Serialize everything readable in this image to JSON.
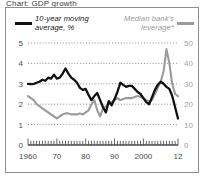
{
  "title_partial": "Chart: GDP growth",
  "legend": {
    "left": {
      "label": "10-year moving average, %",
      "color": "#111111",
      "swatch": "line-swatch-black"
    },
    "right": {
      "label": "Median bank's leverage*",
      "color": "#9b9b9b",
      "swatch": "line-swatch-grey"
    }
  },
  "chart_data": {
    "type": "line",
    "title": "Chart: GDP growth",
    "xlabel": "",
    "ylabel": "10-year moving average, %",
    "y2label": "Median bank's leverage*",
    "grid": true,
    "legend_position": "top",
    "xlim": [
      1960,
      2012
    ],
    "ylim": [
      0,
      5
    ],
    "y2lim": [
      0,
      50
    ],
    "yticks": [
      0,
      1,
      2,
      3,
      4,
      5
    ],
    "y2ticks": [
      0,
      10,
      20,
      30,
      40,
      50
    ],
    "xticks": [
      1960,
      1970,
      1980,
      1990,
      2000,
      2012
    ],
    "xticklabels": [
      "1960",
      "70",
      "80",
      "90",
      "2000",
      "12"
    ],
    "series": [
      {
        "name": "10-year moving average, %",
        "axis": "left",
        "color": "#111111",
        "x": [
          1960,
          1961,
          1962,
          1963,
          1964,
          1965,
          1966,
          1967,
          1968,
          1969,
          1970,
          1971,
          1972,
          1973,
          1974,
          1975,
          1976,
          1977,
          1978,
          1979,
          1980,
          1981,
          1982,
          1983,
          1984,
          1985,
          1986,
          1987,
          1988,
          1989,
          1990,
          1991,
          1992,
          1993,
          1994,
          1995,
          1996,
          1997,
          1998,
          1999,
          2000,
          2001,
          2002,
          2003,
          2004,
          2005,
          2006,
          2007,
          2008,
          2009,
          2010,
          2011,
          2012
        ],
        "values": [
          3.0,
          2.98,
          3.0,
          3.05,
          3.1,
          3.2,
          3.15,
          3.3,
          3.25,
          3.45,
          3.25,
          3.3,
          3.5,
          3.75,
          3.5,
          3.3,
          3.2,
          3.05,
          2.8,
          2.7,
          2.75,
          2.45,
          2.2,
          2.4,
          2.55,
          2.2,
          1.85,
          1.6,
          2.15,
          1.95,
          2.25,
          2.6,
          3.05,
          2.95,
          2.85,
          2.9,
          2.9,
          2.75,
          2.6,
          2.5,
          2.3,
          2.1,
          2.0,
          2.35,
          2.7,
          2.95,
          3.1,
          3.0,
          2.85,
          2.75,
          2.4,
          1.85,
          1.3
        ],
        "annotations": [
          {
            "x": 1973,
            "y": 3.75,
            "note": "peak"
          },
          {
            "x": 2012,
            "y": 1.3,
            "note": "final value"
          }
        ]
      },
      {
        "name": "Median bank's leverage*",
        "axis": "right",
        "color": "#9b9b9b",
        "x": [
          1960,
          1961,
          1962,
          1963,
          1964,
          1965,
          1966,
          1967,
          1968,
          1969,
          1970,
          1971,
          1972,
          1973,
          1974,
          1975,
          1976,
          1977,
          1978,
          1979,
          1980,
          1981,
          1982,
          1983,
          1984,
          1985,
          1986,
          1987,
          1988,
          1989,
          1990,
          1991,
          1992,
          1993,
          1994,
          1995,
          1996,
          1997,
          1998,
          1999,
          2000,
          2001,
          2002,
          2003,
          2004,
          2005,
          2006,
          2007,
          2008,
          2009,
          2010,
          2011,
          2012
        ],
        "values": [
          24,
          23,
          22,
          20,
          19,
          18,
          17,
          16,
          15,
          14,
          13,
          14,
          15,
          15.5,
          15.5,
          15,
          15,
          15,
          15.5,
          15,
          16,
          17,
          20,
          22,
          17,
          14,
          18,
          19,
          20,
          21,
          22,
          23,
          22,
          22.5,
          23,
          23,
          23,
          23.5,
          24,
          23.5,
          23,
          22,
          21.5,
          22,
          25,
          28,
          31,
          36,
          47,
          40,
          30,
          25,
          24
        ],
        "annotations": [
          {
            "x": 2008,
            "y": 47,
            "note": "crisis spike"
          },
          {
            "x": 1970,
            "y": 13,
            "note": "trough"
          }
        ]
      }
    ]
  }
}
